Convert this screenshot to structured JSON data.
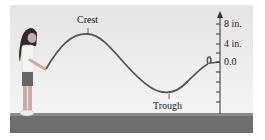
{
  "figure": {
    "labels": {
      "crest": "Crest",
      "trough": "Trough"
    },
    "axis": {
      "tick_labels": [
        "8 in.",
        "4 in.",
        "0.0"
      ]
    },
    "colors": {
      "rope": "#555555",
      "ground": "#6e6e6e",
      "sky_top": "#d8d8d8",
      "sky_bottom": "#f2f2f2"
    }
  }
}
